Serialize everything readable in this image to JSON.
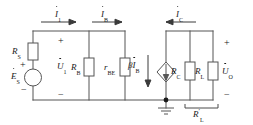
{
  "figure": {
    "type": "circuit-schematic"
  },
  "currents": {
    "i1": {
      "symbol": "I",
      "subscript": "1",
      "phasor": true,
      "direction": "right"
    },
    "ib": {
      "symbol": "I",
      "subscript": "B",
      "phasor": true,
      "direction": "right"
    },
    "ic": {
      "symbol": "I",
      "subscript": "C",
      "phasor": true,
      "direction": "left"
    }
  },
  "voltages": {
    "u1": {
      "symbol": "U",
      "subscript": "1",
      "phasor": true,
      "plus": "+",
      "minus": "−"
    },
    "uo": {
      "symbol": "U",
      "subscript": "O",
      "phasor": true,
      "plus": "+",
      "minus": "−"
    },
    "es": {
      "symbol": "E",
      "subscript": "S",
      "phasor": true,
      "plus": "+",
      "minus": "−"
    }
  },
  "components": {
    "rs": {
      "symbol": "R",
      "subscript": "S",
      "kind": "resistor"
    },
    "rb": {
      "symbol": "R",
      "subscript": "B",
      "kind": "resistor"
    },
    "rbe": {
      "symbol": "r",
      "subscript": "BE",
      "kind": "resistor"
    },
    "rc": {
      "symbol": "R",
      "subscript": "C",
      "kind": "resistor"
    },
    "rl": {
      "symbol": "R",
      "subscript": "L",
      "kind": "resistor"
    },
    "rl_prime": {
      "symbol": "R",
      "prime": "′",
      "subscript": "L",
      "kind": "bracket-label"
    },
    "source_es": {
      "kind": "voltage-source-circle"
    },
    "dependent_source": {
      "beta": "β",
      "symbol": "I",
      "subscript": "B",
      "phasor": true,
      "kind": "dependent-current-source",
      "direction": "down"
    },
    "ground": {
      "kind": "ground-symbol"
    }
  },
  "colors": {
    "wire": "#4a4a4a",
    "text": "#1a1a1a",
    "background": "#ffffff"
  }
}
